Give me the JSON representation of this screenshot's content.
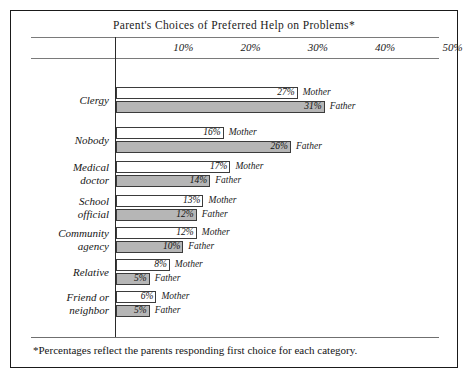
{
  "chart_data": {
    "type": "bar",
    "orientation": "horizontal",
    "title": "Parent's Choices of Preferred Help on Problems*",
    "xlabel": "",
    "ylabel": "",
    "xlim": [
      0,
      55
    ],
    "grid": false,
    "legend_position": "inline-right-of-bar",
    "tick_labels": [
      "10%",
      "20%",
      "30%",
      "40%",
      "50%"
    ],
    "tick_values": [
      10,
      20,
      30,
      40,
      50
    ],
    "categories": [
      "Clergy",
      "Nobody",
      "Medical doctor",
      "School official",
      "Community agency",
      "Relative",
      "Friend or neighbor"
    ],
    "series": [
      {
        "name": "Mother",
        "values": [
          27,
          16,
          17,
          13,
          12,
          8,
          6
        ],
        "color": "#ffffff"
      },
      {
        "name": "Father",
        "values": [
          31,
          26,
          14,
          12,
          10,
          5,
          5
        ],
        "color": "#b6b6b6"
      }
    ],
    "value_labels": [
      [
        "27%",
        "31%"
      ],
      [
        "16%",
        "26%"
      ],
      [
        "17%",
        "14%"
      ],
      [
        "13%",
        "12%"
      ],
      [
        "12%",
        "10%"
      ],
      [
        "8%",
        "5%"
      ],
      [
        "6%",
        "5%"
      ]
    ],
    "annotations": [
      "*Percentages reflect the parents responding first choice for each category."
    ]
  },
  "groups": [
    {
      "label_line1": "Clergy",
      "label_line2": "",
      "mother": {
        "value": 27,
        "label": "27%",
        "series": "Mother"
      },
      "father": {
        "value": 31,
        "label": "31%",
        "series": "Father"
      }
    },
    {
      "label_line1": "Nobody",
      "label_line2": "",
      "mother": {
        "value": 16,
        "label": "16%",
        "series": "Mother"
      },
      "father": {
        "value": 26,
        "label": "26%",
        "series": "Father"
      }
    },
    {
      "label_line1": "Medical",
      "label_line2": "doctor",
      "mother": {
        "value": 17,
        "label": "17%",
        "series": "Mother"
      },
      "father": {
        "value": 14,
        "label": "14%",
        "series": "Father"
      }
    },
    {
      "label_line1": "School",
      "label_line2": "official",
      "mother": {
        "value": 13,
        "label": "13%",
        "series": "Mother"
      },
      "father": {
        "value": 12,
        "label": "12%",
        "series": "Father"
      }
    },
    {
      "label_line1": "Community",
      "label_line2": "agency",
      "mother": {
        "value": 12,
        "label": "12%",
        "series": "Mother"
      },
      "father": {
        "value": 10,
        "label": "10%",
        "series": "Father"
      }
    },
    {
      "label_line1": "Relative",
      "label_line2": "",
      "mother": {
        "value": 8,
        "label": "8%",
        "series": "Mother"
      },
      "father": {
        "value": 5,
        "label": "5%",
        "series": "Father"
      }
    },
    {
      "label_line1": "Friend or",
      "label_line2": "neighbor",
      "mother": {
        "value": 6,
        "label": "6%",
        "series": "Mother"
      },
      "father": {
        "value": 5,
        "label": "5%",
        "series": "Father"
      }
    }
  ],
  "footnote": "*Percentages reflect the parents responding first choice for each category."
}
